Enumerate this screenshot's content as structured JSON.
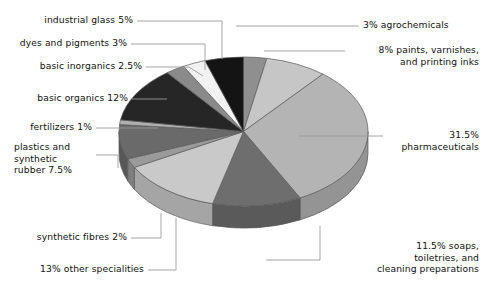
{
  "chart_data": {
    "type": "pie",
    "title": "",
    "subtitle": "",
    "xlabel": "",
    "ylabel": "",
    "legend_position": "none",
    "grid": false,
    "three_d": true,
    "start_angle_deg": 0,
    "direction": "clockwise",
    "units": "percent",
    "categories": [
      "agrochemicals",
      "paints, varnishes, and printing inks",
      "pharmaceuticals",
      "soaps, toiletries, and cleaning preparations",
      "other specialities",
      "synthetic fibres",
      "plastics and synthetic rubber",
      "fertilizers",
      "basic organics",
      "basic inorganics",
      "dyes and pigments",
      "industrial glass"
    ],
    "values": [
      3,
      8,
      31.5,
      11.5,
      13,
      2,
      7.5,
      1,
      12,
      2.5,
      3,
      5
    ],
    "total": 100,
    "slice_colors": [
      "#8f8f8f",
      "#c6c6c6",
      "#b4b4b4",
      "#6e6e6e",
      "#c9c9c9",
      "#9a9a9a",
      "#6a6a6a",
      "#b0b0b0",
      "#262626",
      "#8a8a8a",
      "#f2f2f2",
      "#141414"
    ],
    "slices": [
      {
        "label": "3% agrochemicals",
        "name": "agrochemicals",
        "value": 3,
        "color": "#8f8f8f"
      },
      {
        "label": "8% paints, varnishes,\nand printing inks",
        "name": "paints, varnishes, and printing inks",
        "value": 8,
        "color": "#c6c6c6"
      },
      {
        "label": "31.5%\npharmaceuticals",
        "name": "pharmaceuticals",
        "value": 31.5,
        "color": "#b4b4b4"
      },
      {
        "label": "11.5% soaps,\ntoiletries, and\ncleaning preparations",
        "name": "soaps, toiletries, and cleaning preparations",
        "value": 11.5,
        "color": "#6e6e6e"
      },
      {
        "label": "13% other specialities",
        "name": "other specialities",
        "value": 13,
        "color": "#c9c9c9"
      },
      {
        "label": "synthetic fibres 2%",
        "name": "synthetic fibres",
        "value": 2,
        "color": "#9a9a9a"
      },
      {
        "label": "plastics and\nsynthetic\nrubber 7.5%",
        "name": "plastics and synthetic rubber",
        "value": 7.5,
        "color": "#6a6a6a"
      },
      {
        "label": "fertilizers 1%",
        "name": "fertilizers",
        "value": 1,
        "color": "#b0b0b0"
      },
      {
        "label": "basic organics 12%",
        "name": "basic organics",
        "value": 12,
        "color": "#262626"
      },
      {
        "label": "basic inorganics 2.5%",
        "name": "basic inorganics",
        "value": 2.5,
        "color": "#8a8a8a"
      },
      {
        "label": "dyes and pigments 3%",
        "name": "dyes and pigments",
        "value": 3,
        "color": "#f2f2f2"
      },
      {
        "label": "industrial glass 5%",
        "name": "industrial glass",
        "value": 5,
        "color": "#141414"
      }
    ]
  },
  "labels": {
    "industrial_glass": "industrial glass 5%",
    "dyes_and_pigments": "dyes and pigments 3%",
    "basic_inorganics": "basic inorganics 2.5%",
    "basic_organics": "basic organics 12%",
    "fertilizers": "fertilizers 1%",
    "plastics": "plastics and\nsynthetic\nrubber 7.5%",
    "synthetic_fibres": "synthetic fibres 2%",
    "other_specialities": "13% other specialities",
    "agrochemicals": "3% agrochemicals",
    "paints": "8% paints, varnishes,\nand printing inks",
    "pharmaceuticals": "31.5%\npharmaceuticals",
    "soaps": "11.5% soaps,\ntoiletries, and\ncleaning preparations"
  },
  "colors": {
    "background": "#ffffff",
    "text": "#111111",
    "leader_line": "#9a9a9a",
    "outline": "#555555"
  }
}
